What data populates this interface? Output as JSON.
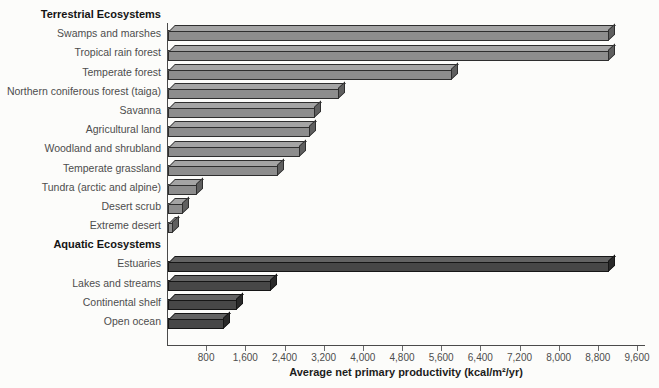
{
  "chart_data": {
    "type": "bar",
    "orientation": "horizontal",
    "title": "",
    "xlabel": "Average net primary productivity (kcal/m²/yr)",
    "ylabel": "",
    "xlim": [
      0,
      9600
    ],
    "grid": false,
    "legend": "none",
    "x_ticks": [
      800,
      1600,
      2400,
      3200,
      4000,
      4800,
      5600,
      6400,
      7200,
      8000,
      8800,
      9600
    ],
    "x_tick_labels": [
      "800",
      "1,600",
      "2,400",
      "3,200",
      "4,000",
      "4,800",
      "5,600",
      "6,400",
      "7,200",
      "8,000",
      "8,800",
      "9,600"
    ],
    "groups": [
      {
        "header": "Terrestrial Ecosystems",
        "color_key": "terrestrial",
        "items": [
          {
            "label": "Swamps and marshes",
            "value": 9000
          },
          {
            "label": "Tropical rain forest",
            "value": 9000
          },
          {
            "label": "Temperate forest",
            "value": 5800
          },
          {
            "label": "Northern coniferous forest (taiga)",
            "value": 3500
          },
          {
            "label": "Savanna",
            "value": 3000
          },
          {
            "label": "Agricultural land",
            "value": 2900
          },
          {
            "label": "Woodland and shrubland",
            "value": 2700
          },
          {
            "label": "Temperate grassland",
            "value": 2250
          },
          {
            "label": "Tundra (arctic and alpine)",
            "value": 600
          },
          {
            "label": "Desert scrub",
            "value": 300
          },
          {
            "label": "Extreme desert",
            "value": 100
          }
        ]
      },
      {
        "header": "Aquatic Ecosystems",
        "color_key": "aquatic",
        "items": [
          {
            "label": "Estuaries",
            "value": 9000
          },
          {
            "label": "Lakes and streams",
            "value": 2100
          },
          {
            "label": "Continental shelf",
            "value": 1400
          },
          {
            "label": "Open ocean",
            "value": 1150
          }
        ]
      }
    ],
    "colors": {
      "terrestrial": {
        "front": "#8d8d8d",
        "top": "#a4a4a4",
        "side": "#5f5f5f",
        "outline": "#2e2e2e"
      },
      "aquatic": {
        "front": "#474747",
        "top": "#636363",
        "side": "#2a2a2a",
        "outline": "#161616"
      },
      "axis": "#4a4a4a",
      "label_text": "#4d4d4d",
      "header_text": "#141414",
      "background": "#fcfcfa"
    }
  }
}
